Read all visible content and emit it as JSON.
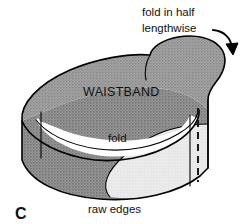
{
  "figure": {
    "letter": "C"
  },
  "annotations": {
    "fold_in_half_line1": "fold in half",
    "fold_in_half_line2": "lengthwise",
    "waistband": "WAISTBAND",
    "fold": "fold",
    "raw_edges": "raw edges"
  },
  "icons": {
    "curved_arrow": "curved-arrow-icon"
  },
  "colors": {
    "ink": "#000000",
    "paper": "#ffffff",
    "fabric_gray": "#9e9e9e",
    "fabric_gray_dark": "#8c8c8c",
    "fabric_light": "#e6e6e6",
    "fabric_inner_white": "#ffffff",
    "stitch": "#1a1a1a"
  }
}
